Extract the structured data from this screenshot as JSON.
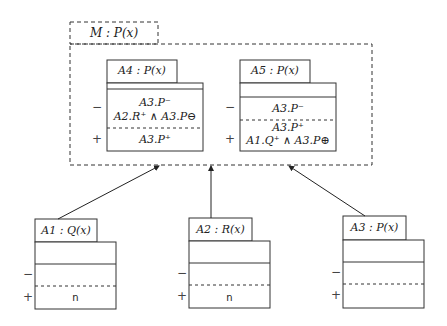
{
  "container": {
    "label": "M : P(x)"
  },
  "inner_boxes": [
    {
      "title": "A4 : P(x)",
      "minus": [
        "A3.P⁻",
        "A2.R⁺ ∧ A3.P⊖"
      ],
      "plus": [
        "A3.P⁺"
      ]
    },
    {
      "title": "A5 : P(x)",
      "minus": [
        "A3.P⁻"
      ],
      "plus": [
        "A3.P⁺",
        "A1.Q⁺ ∧ A3.P⊕"
      ]
    }
  ],
  "outer_boxes": [
    {
      "title": "A1 : Q(x)",
      "minus": [],
      "plus": [
        "n"
      ]
    },
    {
      "title": "A2 : R(x)",
      "minus": [],
      "plus": [
        "n"
      ]
    },
    {
      "title": "A3 : P(x)",
      "minus": [],
      "plus": []
    }
  ],
  "signs": {
    "minus": "−",
    "plus": "+"
  },
  "edges": [
    {
      "from": "A1 : Q(x)",
      "to": "M : P(x)"
    },
    {
      "from": "A2 : R(x)",
      "to": "M : P(x)"
    },
    {
      "from": "A3 : P(x)",
      "to": "M : P(x)"
    }
  ]
}
